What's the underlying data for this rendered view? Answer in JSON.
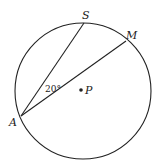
{
  "diagram": {
    "type": "circle-geometry",
    "circle": {
      "center_label": "P",
      "cx": 83,
      "cy": 91,
      "r": 68
    },
    "points": {
      "S": {
        "label": "S",
        "x": 84,
        "y": 23
      },
      "M": {
        "label": "M",
        "x": 126,
        "y": 41
      },
      "A": {
        "label": "A",
        "x": 21,
        "y": 116
      },
      "P": {
        "label": "P",
        "x": 81,
        "y": 90
      }
    },
    "chords": [
      {
        "from": "A",
        "to": "S"
      },
      {
        "from": "A",
        "to": "M"
      }
    ],
    "angle": {
      "vertex": "A",
      "between": [
        "S",
        "M"
      ],
      "label": "20°"
    },
    "stroke_color": "#222222"
  }
}
